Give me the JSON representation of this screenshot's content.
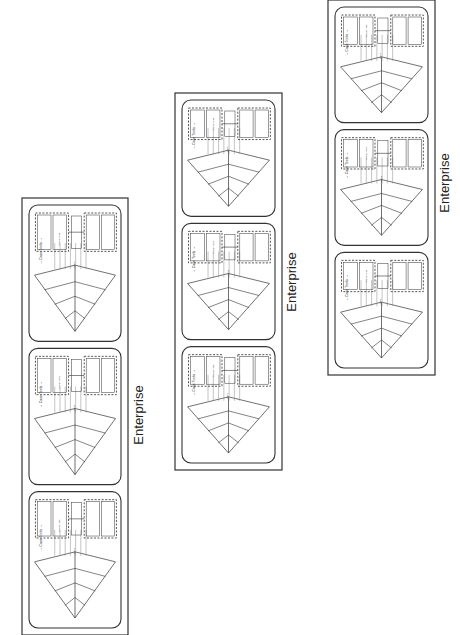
{
  "diagram": {
    "title": "Enterprise",
    "groups": [
      {
        "id": "left",
        "label": "Enterprise",
        "box": {
          "x": 22,
          "y": 198,
          "w": 106,
          "h": 437
        },
        "label_pos": {
          "x": 143,
          "y": 415
        },
        "cards": 3
      },
      {
        "id": "middle",
        "label": "Enterprise",
        "box": {
          "x": 175,
          "y": 93,
          "w": 107,
          "h": 377
        },
        "label_pos": {
          "x": 296,
          "y": 282
        },
        "cards": 3
      },
      {
        "id": "right",
        "label": "Enterprise",
        "box": {
          "x": 328,
          "y": 0,
          "w": 107,
          "h": 375
        },
        "label_pos": {
          "x": 449,
          "y": 183
        },
        "cards": 3
      }
    ],
    "card": {
      "case_tools_label": "Case Tools",
      "capabilities_label": "Capabilities",
      "gaps_label": "Gaps"
    },
    "colors": {
      "line": "#333333",
      "dashed": "#444444",
      "text": "#222222",
      "hatch": "#888888"
    }
  }
}
